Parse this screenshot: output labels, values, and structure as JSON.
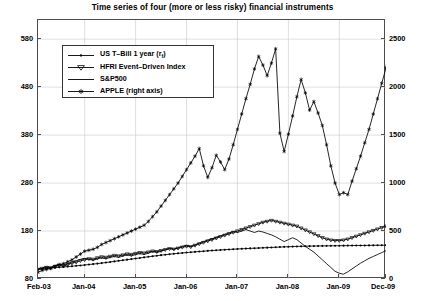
{
  "chart_data": {
    "type": "line",
    "title": "Time series of four (more or less risky) financial instruments",
    "xlabel": "",
    "ylabel": "",
    "grid": true,
    "legend_position": "upper left inside",
    "x_tick_labels": [
      "Feb-03",
      "Jan-04",
      "Jan-05",
      "Jan-06",
      "Jan-07",
      "Jan-08",
      "Jan-09",
      "Dec-09"
    ],
    "x_tick_positions": [
      0,
      11,
      23,
      35,
      47,
      59,
      71,
      82
    ],
    "x_index_range": [
      0,
      82
    ],
    "left_axis": {
      "label": "",
      "ticks": [
        80,
        180,
        280,
        380,
        480,
        580
      ],
      "lim": [
        80,
        620
      ]
    },
    "right_axis": {
      "label": "",
      "ticks": [
        0,
        500,
        1000,
        1500,
        2000,
        2500
      ],
      "lim": [
        0,
        2700
      ]
    },
    "series": [
      {
        "name": "US T-Bill 1 year (r_f)",
        "legend_label": "US T–Bill 1 year (r",
        "legend_label_sub": "f",
        "legend_label_tail": ")",
        "axis": "left",
        "marker": "dot",
        "color": "#000000",
        "values": [
          100,
          100.9,
          101.8,
          102.7,
          103.5,
          104.3,
          105.1,
          105.9,
          106.7,
          107.5,
          108.3,
          109.2,
          110.1,
          111.1,
          112.1,
          113.2,
          114.3,
          115.5,
          116.7,
          117.9,
          119.1,
          120.3,
          121.5,
          122.7,
          123.9,
          125.1,
          126.3,
          127.5,
          128.6,
          129.7,
          130.7,
          131.7,
          132.6,
          133.5,
          134.3,
          135.1,
          135.9,
          136.6,
          137.3,
          138.0,
          138.7,
          139.3,
          139.9,
          140.5,
          141.1,
          141.6,
          142.1,
          142.6,
          143.0,
          143.4,
          143.8,
          144.2,
          144.6,
          145.0,
          145.4,
          145.8,
          146.2,
          146.6,
          147.0,
          147.3,
          147.6,
          147.9,
          148.1,
          148.3,
          148.5,
          148.7,
          148.9,
          149.0,
          149.1,
          149.2,
          149.3,
          149.4,
          149.5,
          149.6,
          149.7,
          149.8,
          149.9,
          150.0,
          150.1,
          150.2,
          150.3,
          150.4,
          150.5
        ]
      },
      {
        "name": "HFRI Event-Driven Index",
        "legend_label": "HFRI Event–Driven Index",
        "axis": "left",
        "marker": "triangle-down",
        "color": "#000000",
        "values": [
          100,
          102,
          104,
          103,
          106,
          108,
          107,
          110,
          113,
          115,
          118,
          120,
          122,
          121,
          124,
          126,
          125,
          127,
          129,
          128,
          130,
          132,
          131,
          133,
          135,
          134,
          136,
          138,
          137,
          139,
          141,
          143,
          142,
          144,
          146,
          148,
          147,
          150,
          153,
          156,
          159,
          162,
          165,
          168,
          171,
          174,
          177,
          180,
          183,
          186,
          189,
          192,
          195,
          198,
          200,
          202,
          200,
          198,
          196,
          194,
          192,
          190,
          186,
          182,
          178,
          174,
          170,
          166,
          163,
          161,
          160,
          160,
          161,
          163,
          166,
          169,
          172,
          175,
          178,
          181,
          184,
          187,
          190,
          193
        ]
      },
      {
        "name": "S&P500",
        "legend_label": "S&P500",
        "axis": "left",
        "marker": "none",
        "color": "#000000",
        "values": [
          100,
          103,
          106,
          104,
          108,
          111,
          109,
          112,
          116,
          118,
          121,
          123,
          121,
          119,
          122,
          124,
          122,
          125,
          127,
          125,
          128,
          130,
          128,
          131,
          133,
          131,
          134,
          137,
          135,
          138,
          141,
          144,
          142,
          145,
          148,
          150,
          148,
          151,
          155,
          158,
          161,
          164,
          167,
          170,
          173,
          176,
          179,
          177,
          180,
          183,
          180,
          177,
          180,
          178,
          175,
          172,
          168,
          163,
          158,
          162,
          166,
          162,
          155,
          148,
          142,
          136,
          128,
          120,
          112,
          104,
          96,
          92,
          90,
          95,
          101,
          107,
          113,
          118,
          123,
          127,
          131,
          135,
          139,
          143
        ]
      },
      {
        "name": "APPLE (right axis)",
        "legend_label": "APPLE (right axis)",
        "axis": "right",
        "marker": "asterisk",
        "color": "#000000",
        "values": [
          70,
          90,
          100,
          110,
          130,
          150,
          160,
          180,
          200,
          230,
          260,
          290,
          300,
          310,
          330,
          360,
          380,
          400,
          420,
          440,
          460,
          480,
          500,
          520,
          540,
          560,
          600,
          650,
          700,
          760,
          820,
          880,
          940,
          1000,
          1070,
          1140,
          1210,
          1280,
          1360,
          1180,
          1060,
          1160,
          1290,
          1220,
          1140,
          1250,
          1400,
          1560,
          1720,
          1880,
          2030,
          2190,
          2320,
          2230,
          2120,
          2250,
          2400,
          1520,
          1330,
          1510,
          1700,
          1900,
          2080,
          1940,
          1760,
          1850,
          1730,
          1600,
          1400,
          1180,
          1000,
          880,
          900,
          880,
          1020,
          1150,
          1280,
          1420,
          1560,
          1720,
          1880,
          2040,
          2200,
          2620
        ]
      }
    ]
  }
}
